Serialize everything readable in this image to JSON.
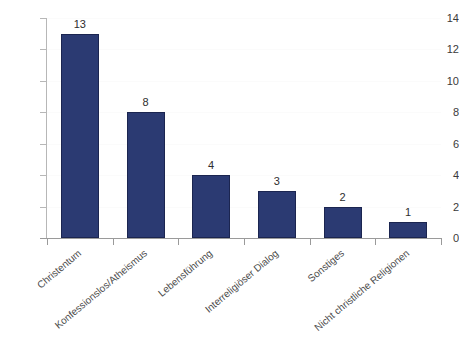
{
  "chart_data": {
    "type": "bar",
    "title": "",
    "subtitle": "",
    "xlabel": "",
    "ylabel": "",
    "categories": [
      "Christentum",
      "Konfessionslos/Atheismus",
      "Lebensführung",
      "Interreligiöser Dialog",
      "Sonstiges",
      "Nicht christliche Religionen"
    ],
    "values": [
      13,
      8,
      4,
      3,
      2,
      1
    ],
    "value_labels": [
      "13",
      "8",
      "4",
      "3",
      "2",
      "1"
    ],
    "ylim": [
      0,
      14
    ],
    "ytick_values": [
      0,
      2,
      4,
      6,
      8,
      10,
      12,
      14
    ],
    "ytick_labels": [
      "0",
      "2",
      "4",
      "6",
      "8",
      "10",
      "12",
      "14"
    ],
    "grid": false,
    "legend": false,
    "legend_position": "none",
    "bar_color": "#2b3a72",
    "bar_border_color": "#1b2550",
    "axis_color": "#9a9a9a",
    "background_color": "#ffffff",
    "data_labels_shown": true,
    "xtick_label_rotation": -40
  }
}
